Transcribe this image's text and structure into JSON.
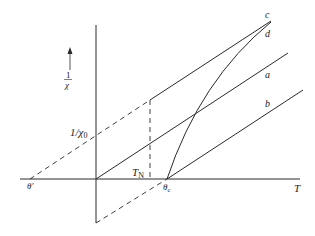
{
  "figure": {
    "y_axis_label_numerator": "1",
    "y_axis_label_denominator": "χ",
    "x_axis_label": "T",
    "intercept_label": "1/χ",
    "intercept_subscript": "0",
    "theta_prime_label": "θ'",
    "theta_c_label": "θ",
    "theta_c_subscript": "c",
    "tn_label": "T",
    "tn_subscript": "N",
    "curve_labels": {
      "a": "a",
      "b": "b",
      "c": "c",
      "d": "d"
    }
  },
  "colors": {
    "line": "#2a2a2a",
    "background": "#ffffff"
  }
}
